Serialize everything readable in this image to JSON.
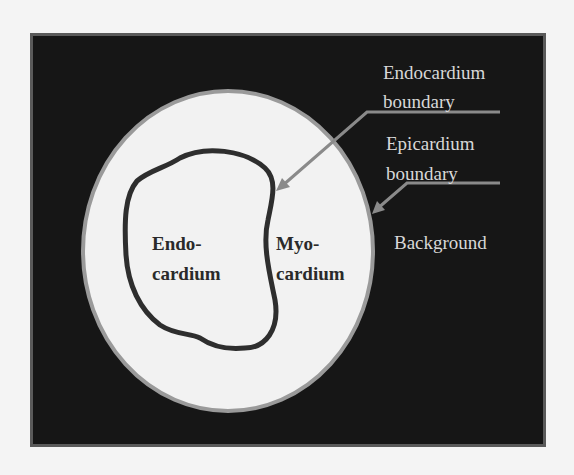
{
  "diagram": {
    "title": "",
    "regions": {
      "endocardium": {
        "line1": "Endo-",
        "line2": "cardium"
      },
      "myocardium": {
        "line1": "Myo-",
        "line2": "cardium"
      },
      "background": {
        "label": "Background"
      }
    },
    "callouts": {
      "endocardium_boundary": {
        "line1": "Endocardium",
        "line2": "boundary"
      },
      "epicardium_boundary": {
        "line1": "Epicardium",
        "line2": "boundary"
      }
    },
    "colors": {
      "page": "#f4f4f4",
      "frame_fill": "#161616",
      "frame_border": "#5a5a5a",
      "epicardium_fill": "#f2f2f2",
      "epicardium_edge": "#9a9a9a",
      "endocardium_contour": "#2e2e2e",
      "arrow": "#8a8a8a",
      "light_text": "#d8d8d8"
    }
  }
}
